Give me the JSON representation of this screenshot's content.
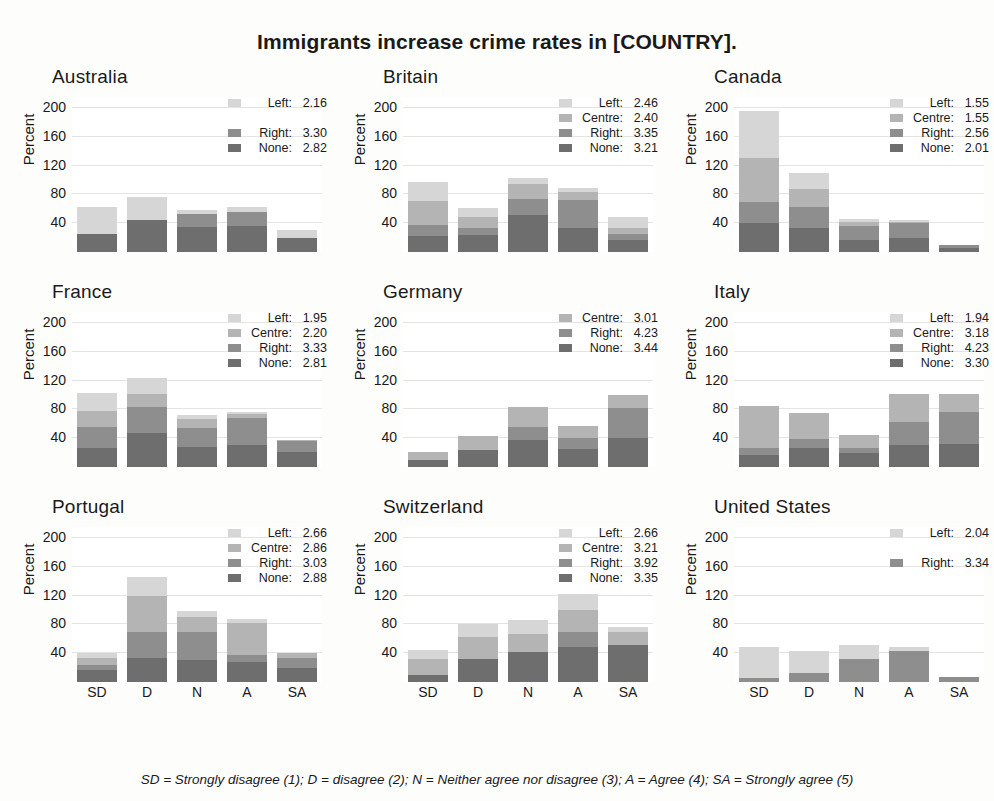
{
  "title": "Immigrants increase crime rates in [COUNTRY].",
  "footnote": "SD = Strongly disagree (1); D = disagree (2); N = Neither agree nor disagree (3); A = Agree (4); SA = Strongly agree (5)",
  "ylabel": "Percent",
  "colors": {
    "Left": "#d6d6d6",
    "Centre": "#b4b4b4",
    "Right": "#8e8e8e",
    "None": "#6e6e6e"
  },
  "chart_data": {
    "type": "bar",
    "title": "Immigrants increase crime rates in [COUNTRY].",
    "xlabel": "",
    "ylabel": "Percent",
    "stacked": true,
    "grid": true,
    "legend_position": "top-right",
    "ylim": [
      0,
      215
    ],
    "yticks": [
      40,
      80,
      120,
      160,
      200
    ],
    "categories": [
      "SD",
      "D",
      "N",
      "A",
      "SA"
    ],
    "series_order": [
      "None",
      "Right",
      "Centre",
      "Left"
    ],
    "panels": [
      {
        "name": "Australia",
        "legend": [
          {
            "name": "Left",
            "value": "2.16"
          },
          {
            "name": "",
            "value": ""
          },
          {
            "name": "Right",
            "value": "3.30"
          },
          {
            "name": "None",
            "value": "2.82"
          }
        ],
        "series": [
          {
            "name": "None",
            "values": [
              25,
              45,
              35,
              36,
              20
            ]
          },
          {
            "name": "Right",
            "values": [
              0,
              0,
              18,
              20,
              0
            ]
          },
          {
            "name": "Centre",
            "values": [
              0,
              0,
              0,
              0,
              0
            ]
          },
          {
            "name": "Left",
            "values": [
              37,
              32,
              6,
              6,
              10
            ]
          }
        ]
      },
      {
        "name": "Britain",
        "legend": [
          {
            "name": "Left",
            "value": "2.46"
          },
          {
            "name": "Centre",
            "value": "2.40"
          },
          {
            "name": "Right",
            "value": "3.35"
          },
          {
            "name": "None",
            "value": "3.21"
          }
        ],
        "series": [
          {
            "name": "None",
            "values": [
              22,
              23,
              52,
              34,
              17
            ]
          },
          {
            "name": "Right",
            "values": [
              15,
              11,
              22,
              38,
              8
            ]
          },
          {
            "name": "Centre",
            "values": [
              34,
              15,
              20,
              11,
              8
            ]
          },
          {
            "name": "Left",
            "values": [
              26,
              12,
              8,
              6,
              16
            ]
          }
        ]
      },
      {
        "name": "Canada",
        "legend": [
          {
            "name": "Left",
            "value": "1.55"
          },
          {
            "name": "Centre",
            "value": "1.55"
          },
          {
            "name": "Right",
            "value": "2.56"
          },
          {
            "name": "None",
            "value": "2.01"
          }
        ],
        "series": [
          {
            "name": "None",
            "values": [
              40,
              34,
              16,
              20,
              6
            ]
          },
          {
            "name": "Right",
            "values": [
              29,
              29,
              20,
              20,
              4
            ]
          },
          {
            "name": "Centre",
            "values": [
              62,
              24,
              6,
              2,
              0
            ]
          },
          {
            "name": "Left",
            "values": [
              64,
              22,
              4,
              2,
              0
            ]
          }
        ]
      },
      {
        "name": "France",
        "legend": [
          {
            "name": "Left",
            "value": "1.95"
          },
          {
            "name": "Centre",
            "value": "2.20"
          },
          {
            "name": "Right",
            "value": "3.33"
          },
          {
            "name": "None",
            "value": "2.81"
          }
        ],
        "series": [
          {
            "name": "None",
            "values": [
              26,
              47,
              28,
              30,
              21
            ]
          },
          {
            "name": "Right",
            "values": [
              30,
              36,
              26,
              38,
              15
            ]
          },
          {
            "name": "Centre",
            "values": [
              22,
              18,
              12,
              6,
              2
            ]
          },
          {
            "name": "Left",
            "values": [
              24,
              22,
              6,
              2,
              0
            ]
          }
        ]
      },
      {
        "name": "Germany",
        "legend": [
          {
            "name": "Centre",
            "value": "3.01"
          },
          {
            "name": "Right",
            "value": "4.23"
          },
          {
            "name": "None",
            "value": "3.44"
          }
        ],
        "series": [
          {
            "name": "None",
            "values": [
              10,
              24,
              38,
              25,
              40
            ]
          },
          {
            "name": "Right",
            "values": [
              0,
              0,
              18,
              15,
              42
            ]
          },
          {
            "name": "Centre",
            "values": [
              11,
              19,
              27,
              17,
              18
            ]
          },
          {
            "name": "Left",
            "values": [
              0,
              0,
              0,
              0,
              0
            ]
          }
        ]
      },
      {
        "name": "Italy",
        "legend": [
          {
            "name": "Left",
            "value": "1.94"
          },
          {
            "name": "Centre",
            "value": "3.18"
          },
          {
            "name": "Right",
            "value": "4.23"
          },
          {
            "name": "None",
            "value": "3.30"
          }
        ],
        "series": [
          {
            "name": "None",
            "values": [
              17,
              27,
              20,
              30,
              32
            ]
          },
          {
            "name": "Right",
            "values": [
              9,
              12,
              6,
              33,
              44
            ]
          },
          {
            "name": "Centre",
            "values": [
              58,
              36,
              19,
              38,
              25
            ]
          },
          {
            "name": "Left",
            "values": [
              0,
              0,
              0,
              0,
              0
            ]
          }
        ]
      },
      {
        "name": "Portugal",
        "legend": [
          {
            "name": "Left",
            "value": "2.66"
          },
          {
            "name": "Centre",
            "value": "2.86"
          },
          {
            "name": "Right",
            "value": "3.03"
          },
          {
            "name": "None",
            "value": "2.88"
          }
        ],
        "series": [
          {
            "name": "None",
            "values": [
              17,
              34,
              30,
              28,
              20
            ]
          },
          {
            "name": "Right",
            "values": [
              7,
              35,
              40,
              10,
              13
            ]
          },
          {
            "name": "Centre",
            "values": [
              10,
              50,
              20,
              44,
              7
            ]
          },
          {
            "name": "Left",
            "values": [
              6,
              27,
              8,
              6,
              0
            ]
          }
        ]
      },
      {
        "name": "Switzerland",
        "legend": [
          {
            "name": "Left",
            "value": "2.66"
          },
          {
            "name": "Centre",
            "value": "3.21"
          },
          {
            "name": "Right",
            "value": "3.92"
          },
          {
            "name": "None",
            "value": "3.35"
          }
        ],
        "series": [
          {
            "name": "None",
            "values": [
              10,
              32,
              42,
              48,
              52
            ]
          },
          {
            "name": "Right",
            "values": [
              0,
              0,
              0,
              22,
              0
            ]
          },
          {
            "name": "Centre",
            "values": [
              22,
              30,
              24,
              30,
              18
            ]
          },
          {
            "name": "Left",
            "values": [
              12,
              18,
              20,
              22,
              6
            ]
          }
        ]
      },
      {
        "name": "United States",
        "legend": [
          {
            "name": "Left",
            "value": "2.04"
          },
          {
            "name": "",
            "value": ""
          },
          {
            "name": "Right",
            "value": "3.34"
          }
        ],
        "series": [
          {
            "name": "None",
            "values": [
              0,
              0,
              0,
              0,
              0
            ]
          },
          {
            "name": "Right",
            "values": [
              6,
              13,
              32,
              43,
              7
            ]
          },
          {
            "name": "Centre",
            "values": [
              0,
              0,
              0,
              0,
              0
            ]
          },
          {
            "name": "Left",
            "values": [
              42,
              30,
              19,
              5,
              0
            ]
          }
        ]
      }
    ]
  }
}
